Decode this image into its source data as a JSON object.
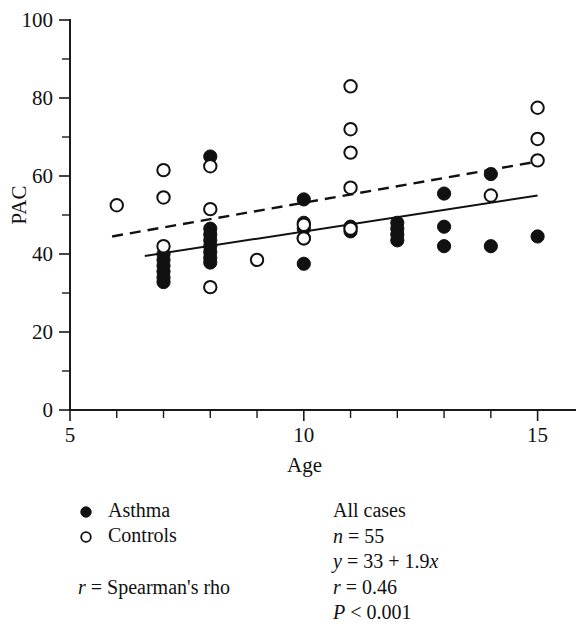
{
  "chart_data": {
    "type": "scatter",
    "title": "",
    "xlabel": "Age",
    "ylabel": "PAC",
    "xlim": [
      5,
      15.8
    ],
    "ylim": [
      0,
      100
    ],
    "grid": false,
    "x_ticks_major": [
      5,
      10,
      15
    ],
    "x_ticks_minor": [
      6,
      7,
      8,
      9,
      11,
      12,
      13,
      14
    ],
    "x_tick_labels": [
      "5",
      "10",
      "15"
    ],
    "y_ticks_major": [
      0,
      20,
      40,
      60,
      80,
      100
    ],
    "y_ticks_minor": [
      10,
      30,
      50,
      70,
      90
    ],
    "y_tick_labels": [
      "0",
      "20",
      "40",
      "60",
      "80",
      "100"
    ],
    "legend_position": "below-left",
    "series": [
      {
        "name": "Asthma",
        "marker": "filled-circle",
        "points": [
          [
            7,
            40.0
          ],
          [
            7,
            38.5
          ],
          [
            7,
            37.0
          ],
          [
            7,
            35.5
          ],
          [
            7,
            34.0
          ],
          [
            7,
            32.8
          ],
          [
            8,
            65.0
          ],
          [
            8,
            46.5
          ],
          [
            8,
            45.0
          ],
          [
            8,
            43.5
          ],
          [
            8,
            42.0
          ],
          [
            8,
            40.5
          ],
          [
            8,
            39.0
          ],
          [
            8,
            37.8
          ],
          [
            10,
            54.0
          ],
          [
            10,
            48.0
          ],
          [
            10,
            46.5
          ],
          [
            10,
            44.0
          ],
          [
            10,
            37.5
          ],
          [
            11,
            47.0
          ],
          [
            11,
            45.8
          ],
          [
            12,
            48.0
          ],
          [
            12,
            46.5
          ],
          [
            12,
            45.0
          ],
          [
            12,
            43.5
          ],
          [
            13,
            55.5
          ],
          [
            13,
            47.0
          ],
          [
            13,
            42.0
          ],
          [
            14,
            60.5
          ],
          [
            14,
            42.0
          ],
          [
            15,
            44.5
          ]
        ]
      },
      {
        "name": "Controls",
        "marker": "open-circle",
        "points": [
          [
            6,
            52.5
          ],
          [
            7,
            61.5
          ],
          [
            7,
            54.5
          ],
          [
            7,
            42.0
          ],
          [
            8,
            62.5
          ],
          [
            8,
            51.5
          ],
          [
            8,
            31.5
          ],
          [
            9,
            38.5
          ],
          [
            10,
            47.5
          ],
          [
            10,
            44.0
          ],
          [
            11,
            83.0
          ],
          [
            11,
            72.0
          ],
          [
            11,
            66.0
          ],
          [
            11,
            57.0
          ],
          [
            11,
            46.5
          ],
          [
            14,
            55.0
          ],
          [
            15,
            77.5
          ],
          [
            15,
            69.5
          ],
          [
            15,
            64.0
          ]
        ]
      }
    ],
    "fit_lines": [
      {
        "name": "Asthma fit",
        "style": "solid",
        "x0": 6.6,
        "y0": 39.5,
        "x1": 15.0,
        "y1": 55.0
      },
      {
        "name": "Controls fit",
        "style": "dashed",
        "x0": 5.9,
        "y0": 44.5,
        "x1": 14.9,
        "y1": 63.5
      }
    ]
  },
  "legend": {
    "items": [
      {
        "label": "Asthma",
        "marker": "filled-circle"
      },
      {
        "label": "Controls",
        "marker": "open-circle"
      }
    ],
    "note_var": "r",
    "note_rest": " = Spearman's rho"
  },
  "stats": {
    "heading": "All cases",
    "n_var": "n",
    "n_rest": " = 55",
    "eq_var": "y",
    "eq_mid": " = 33 + 1.9",
    "eq_x": "x",
    "r_var": "r",
    "r_rest": " = 0.46",
    "p_var": "P",
    "p_rest": " < 0.001"
  },
  "axes": {
    "x_title": "Age",
    "y_title": "PAC"
  }
}
